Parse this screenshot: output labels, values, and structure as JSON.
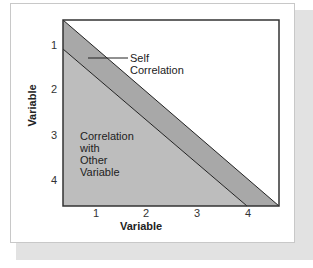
{
  "diagram": {
    "type": "correlation-matrix-schematic",
    "colors": {
      "self_band": "#a8a8a8",
      "other_region": "#bdbdbd",
      "frame": "#333333",
      "shadow": "#e2e2e2"
    },
    "axes": {
      "x": {
        "label": "Variable",
        "ticks": [
          "1",
          "2",
          "3",
          "4"
        ]
      },
      "y": {
        "label": "Variable",
        "ticks": [
          "1",
          "2",
          "3",
          "4"
        ]
      }
    },
    "annotations": {
      "self": {
        "line1": "Self",
        "line2": "Correlation"
      },
      "other": {
        "line1": "Correlation",
        "line2": "with",
        "line3": "Other",
        "line4": "Variable"
      }
    }
  }
}
